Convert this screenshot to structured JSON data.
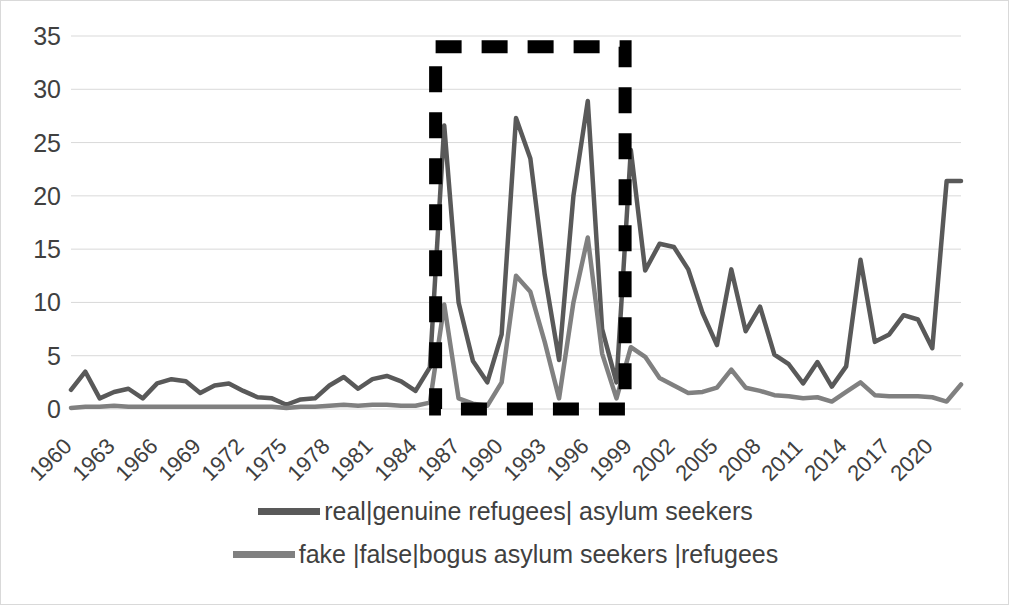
{
  "chart_data": {
    "type": "line",
    "title": "",
    "xlabel": "",
    "ylabel": "",
    "ylim": [
      0,
      35
    ],
    "ytick_step": 5,
    "yticks": [
      0,
      5,
      10,
      15,
      20,
      25,
      30,
      35
    ],
    "grid": true,
    "legend_position": "bottom",
    "x_tick_labels": [
      "1960",
      "1963",
      "1966",
      "1969",
      "1972",
      "1975",
      "1978",
      "1981",
      "1984",
      "1987",
      "1990",
      "1993",
      "1996",
      "1999",
      "2002",
      "2005",
      "2008",
      "2011",
      "2014",
      "2017",
      "2020"
    ],
    "x": [
      1960,
      1961,
      1962,
      1963,
      1964,
      1965,
      1966,
      1967,
      1968,
      1969,
      1970,
      1971,
      1972,
      1973,
      1974,
      1975,
      1976,
      1977,
      1978,
      1979,
      1980,
      1981,
      1982,
      1983,
      1984,
      1985,
      1986,
      1987,
      1988,
      1989,
      1990,
      1991,
      1992,
      1993,
      1994,
      1995,
      1996,
      1997,
      1998,
      1999,
      2000,
      2001,
      2002,
      2003,
      2004,
      2005,
      2006,
      2007,
      2008,
      2009,
      2010,
      2011,
      2012,
      2013,
      2014,
      2015,
      2016,
      2017,
      2018,
      2019,
      2020,
      2021,
      2022
    ],
    "series": [
      {
        "name": "real|genuine refugees| asylum seekers",
        "color": "#595959",
        "values": [
          1.8,
          3.5,
          1.0,
          1.6,
          1.9,
          1.0,
          2.4,
          2.8,
          2.6,
          1.5,
          2.2,
          2.4,
          1.7,
          1.1,
          1.0,
          0.4,
          0.9,
          1.0,
          2.2,
          3.0,
          1.9,
          2.8,
          3.1,
          2.6,
          1.7,
          3.9,
          26.6,
          10.0,
          4.5,
          2.5,
          7.0,
          27.3,
          23.5,
          12.6,
          4.6,
          20.0,
          28.9,
          7.5,
          2.5,
          24.3,
          13.0,
          15.5,
          15.2,
          13.1,
          9.0,
          6.0,
          13.1,
          7.3,
          9.6,
          5.1,
          4.2,
          2.4,
          4.4,
          2.1,
          4.0,
          14.0,
          6.3,
          7.0,
          8.8,
          8.4,
          5.7,
          21.4,
          21.4
        ]
      },
      {
        "name": "fake |false|bogus asylum seekers |refugees",
        "color": "#808080",
        "values": [
          0.1,
          0.2,
          0.2,
          0.3,
          0.2,
          0.2,
          0.2,
          0.2,
          0.2,
          0.2,
          0.2,
          0.2,
          0.2,
          0.2,
          0.2,
          0.1,
          0.2,
          0.2,
          0.3,
          0.4,
          0.3,
          0.4,
          0.4,
          0.3,
          0.3,
          0.6,
          9.8,
          1.0,
          0.5,
          0.3,
          2.5,
          12.5,
          11.0,
          6.3,
          1.0,
          10.0,
          16.1,
          5.2,
          1.0,
          5.8,
          4.9,
          2.9,
          2.2,
          1.5,
          1.6,
          2.0,
          3.7,
          2.0,
          1.7,
          1.3,
          1.2,
          1.0,
          1.1,
          0.7,
          1.6,
          2.5,
          1.3,
          1.2,
          1.2,
          1.2,
          1.1,
          0.7,
          2.3
        ]
      }
    ],
    "annotations": [
      {
        "name": "dashed-highlight-box",
        "style": "dashed-rectangle",
        "color": "#000000",
        "x_start": 1985.4,
        "x_end": 1998.6,
        "y_start": 0,
        "y_end": 34
      }
    ]
  },
  "legend": {
    "items": [
      {
        "label": "real|genuine refugees| asylum seekers",
        "color": "#595959"
      },
      {
        "label": "fake |false|bogus asylum seekers |refugees",
        "color": "#808080"
      }
    ]
  }
}
